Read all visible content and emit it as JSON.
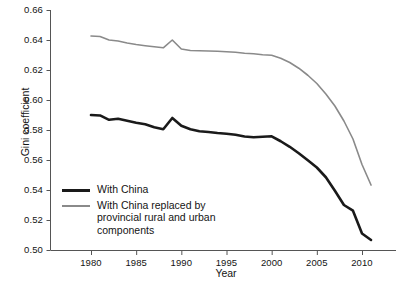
{
  "chart_data": {
    "type": "line",
    "title": "",
    "xlabel": "Year",
    "ylabel": "Gini coefficient",
    "xlim": [
      1976.5,
      2014.0
    ],
    "ylim": [
      0.5,
      0.66
    ],
    "xticks": [
      1980,
      1985,
      1990,
      1995,
      2000,
      2005,
      2010
    ],
    "xtick_labels": [
      "1980",
      "1985",
      "1990",
      "1995",
      "2000",
      "2005",
      "2010"
    ],
    "yticks": [
      0.5,
      0.52,
      0.54,
      0.56,
      0.58,
      0.6,
      0.62,
      0.64,
      0.66
    ],
    "ytick_labels": [
      "0.50",
      "0.52",
      "0.54",
      "0.56",
      "0.58",
      "0.60",
      "0.62",
      "0.64",
      "0.66"
    ],
    "grid": false,
    "legend_position": "lower-left",
    "x": [
      1980,
      1981,
      1982,
      1983,
      1984,
      1985,
      1986,
      1987,
      1988,
      1989,
      1990,
      1991,
      1992,
      1993,
      1994,
      1995,
      1996,
      1997,
      1998,
      1999,
      2000,
      2001,
      2002,
      2003,
      2004,
      2005,
      2006,
      2007,
      2008,
      2009,
      2010,
      2011
    ],
    "series": [
      {
        "name": "With China",
        "color": "#1a1a1a",
        "width": 2.6,
        "values": [
          0.59,
          0.5897,
          0.5868,
          0.5875,
          0.5862,
          0.5848,
          0.5838,
          0.5818,
          0.5805,
          0.588,
          0.5828,
          0.5805,
          0.5792,
          0.5787,
          0.578,
          0.5775,
          0.5768,
          0.5757,
          0.5752,
          0.5755,
          0.5758,
          0.5725,
          0.5688,
          0.5645,
          0.5598,
          0.555,
          0.5485,
          0.5395,
          0.53,
          0.5262,
          0.511,
          0.5067
        ]
      },
      {
        "name": "With China replaced by provincial rural and urban components",
        "color": "#8a8a8a",
        "width": 1.6,
        "values": [
          0.6427,
          0.6423,
          0.64,
          0.6393,
          0.638,
          0.637,
          0.6362,
          0.6355,
          0.6348,
          0.64,
          0.634,
          0.633,
          0.6328,
          0.6327,
          0.6325,
          0.6322,
          0.6318,
          0.6312,
          0.6308,
          0.6302,
          0.6298,
          0.6278,
          0.625,
          0.6212,
          0.6165,
          0.611,
          0.604,
          0.596,
          0.586,
          0.574,
          0.557,
          0.5433
        ]
      }
    ],
    "legend": [
      {
        "label": "With China",
        "color": "#1a1a1a",
        "style": "thick"
      },
      {
        "label": "With China replaced by\nprovincial rural and urban\ncomponents",
        "color": "#8a8a8a",
        "style": "thin"
      }
    ]
  }
}
